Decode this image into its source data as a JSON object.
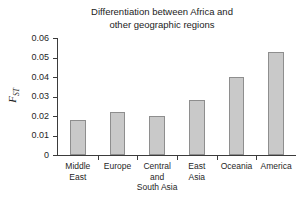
{
  "chart_data": {
    "type": "bar",
    "title": "Differentiation between Africa and other geographic regions",
    "title_lines": [
      "Differentiation between Africa and",
      "other geographic regions"
    ],
    "xlabel": "",
    "ylabel": "FST",
    "ylabel_parts": {
      "symbol": "F",
      "subscript": "ST"
    },
    "categories": [
      "Middle East",
      "Europe",
      "Central and South Asia",
      "East Asia",
      "Oceania",
      "America"
    ],
    "category_lines": [
      [
        "Middle",
        "East"
      ],
      [
        "Europe"
      ],
      [
        "Central",
        "and",
        "South Asia"
      ],
      [
        "East",
        "Asia"
      ],
      [
        "Oceania"
      ],
      [
        "America"
      ]
    ],
    "values": [
      0.018,
      0.022,
      0.02,
      0.028,
      0.04,
      0.053
    ],
    "ylim": [
      0,
      0.06
    ],
    "yticks": [
      0,
      0.01,
      0.02,
      0.03,
      0.04,
      0.05,
      0.06
    ],
    "ytick_labels": [
      "0",
      "0.01",
      "0.02",
      "0.03",
      "0.04",
      "0.05",
      "0.06"
    ],
    "grid": false,
    "legend": false,
    "bar_color": "#c9c9c9",
    "bar_border_color": "#8e8e8e",
    "axis_color": "#3b3b3b",
    "background": "#ffffff"
  }
}
